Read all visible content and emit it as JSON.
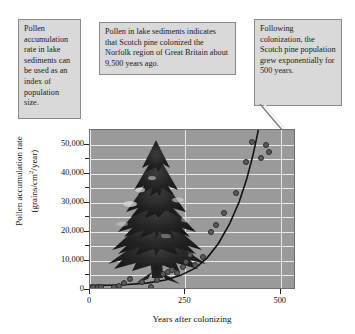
{
  "callouts": {
    "left": "Pollen accumulation rate in lake sediments can be used as an index of population size.",
    "middle": "Pollen in lake sediments indicates that Scotch pine colonized the Norfolk region of Great Britain about 9,500 years ago.",
    "right": "Following colonization, the Scotch pine population grew exponentially for 500 years."
  },
  "colors": {
    "plot_background": "#9a9a9a",
    "gridline": "#e8e8e8",
    "point_fill": "#5c5c5c",
    "point_stroke": "#2b2b2b",
    "curve": "#111111",
    "callout_background": "#d9d9d9",
    "callout_border": "#8a8a8a"
  },
  "chart_data": {
    "type": "scatter",
    "title": "",
    "xlabel": "Years after colonizing",
    "ylabel": "Pollen accumulation rate (grains/cm2/year)",
    "ylabel_line1": "Pollen accumulation rate",
    "ylabel_line2_pre": "(grains/cm",
    "ylabel_line2_sup": "2",
    "ylabel_line2_post": "/year)",
    "xlim": [
      0,
      540
    ],
    "ylim": [
      0,
      55000
    ],
    "xticks": [
      0,
      250,
      500
    ],
    "xtick_labels": [
      "0",
      "250",
      "500"
    ],
    "yticks": [
      0,
      10000,
      20000,
      30000,
      40000,
      50000
    ],
    "ytick_labels": [
      "0",
      "10,000",
      "20,000",
      "30,000",
      "40,000",
      "50,000"
    ],
    "yticks_minor": [
      5000,
      15000,
      25000,
      35000,
      45000
    ],
    "grid": true,
    "grid_orientation": "both",
    "legend": "none",
    "series": [
      {
        "name": "Pollen accumulation rate",
        "points": [
          [
            8,
            1000
          ],
          [
            20,
            1200
          ],
          [
            30,
            1100
          ],
          [
            62,
            900
          ],
          [
            75,
            1500
          ],
          [
            90,
            2500
          ],
          [
            105,
            3800
          ],
          [
            135,
            2800
          ],
          [
            160,
            900
          ],
          [
            175,
            3500
          ],
          [
            192,
            5500
          ],
          [
            205,
            6200
          ],
          [
            215,
            7000
          ],
          [
            228,
            5800
          ],
          [
            243,
            8000
          ],
          [
            252,
            9500
          ],
          [
            262,
            12000
          ],
          [
            276,
            8500
          ],
          [
            295,
            11500
          ],
          [
            318,
            20000
          ],
          [
            330,
            22500
          ],
          [
            352,
            26500
          ],
          [
            382,
            33500
          ],
          [
            410,
            44000
          ],
          [
            425,
            51000
          ],
          [
            447,
            45500
          ],
          [
            462,
            50000
          ],
          [
            470,
            47500
          ]
        ]
      }
    ],
    "fit_curve": {
      "name": "exponential growth fit",
      "points": [
        [
          0,
          900
        ],
        [
          50,
          950
        ],
        [
          100,
          1200
        ],
        [
          150,
          1700
        ],
        [
          200,
          2800
        ],
        [
          240,
          4400
        ],
        [
          280,
          7000
        ],
        [
          310,
          10500
        ],
        [
          340,
          15500
        ],
        [
          370,
          22500
        ],
        [
          395,
          30000
        ],
        [
          415,
          38000
        ],
        [
          430,
          45500
        ],
        [
          440,
          51500
        ],
        [
          447,
          56000
        ]
      ]
    }
  }
}
